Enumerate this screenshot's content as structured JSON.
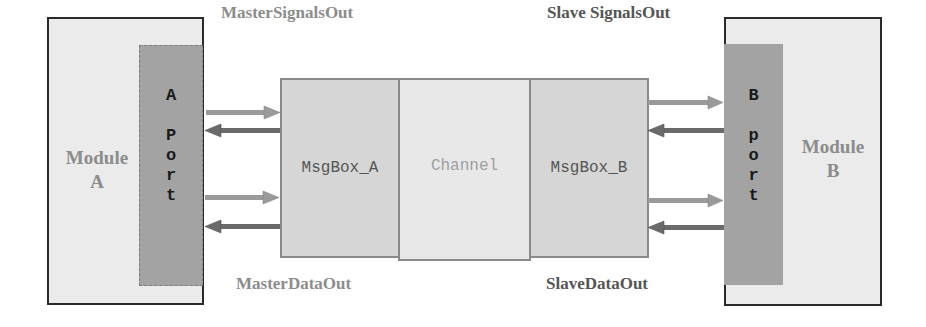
{
  "diagram": {
    "module_a": {
      "label_line1": "Module",
      "label_line2": "A"
    },
    "module_b": {
      "label_line1": "Module",
      "label_line2": "B"
    },
    "port_a": {
      "letters": [
        "A",
        "",
        "P",
        "o",
        "r",
        "t"
      ]
    },
    "port_b": {
      "letters": [
        "B",
        "",
        "p",
        "o",
        "r",
        "t"
      ]
    },
    "msgbox_a": {
      "label": "MsgBox_A"
    },
    "channel": {
      "label": "Channel"
    },
    "msgbox_b": {
      "label": "MsgBox_B"
    },
    "labels": {
      "master_signals_out": "MasterSignalsOut",
      "slave_signals_out": "Slave SignalsOut",
      "master_data_out": "MasterDataOut",
      "slave_data_out": "SlaveDataOut"
    },
    "arrows": {
      "left_side": [
        "to-msgbox-a",
        "to-port-a",
        "to-msgbox-a",
        "to-port-a"
      ],
      "right_side": [
        "to-port-b",
        "to-msgbox-b",
        "to-port-b",
        "to-msgbox-b"
      ]
    },
    "colors": {
      "module_fill": "#ebebeb",
      "port_fill": "#a3a3a3",
      "msgbox_fill": "#d6d6d6",
      "channel_fill": "#e8e8e8",
      "arrow_light": "#9a9a9a",
      "arrow_dark": "#6a6a6a",
      "label_light": "#8c8c8c",
      "label_dark": "#555555"
    }
  }
}
